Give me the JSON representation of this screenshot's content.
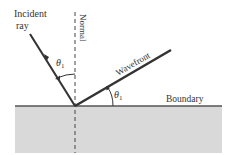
{
  "diagram": {
    "labels": {
      "incident_line1": "Incident",
      "incident_line2": "ray",
      "normal": "Normal",
      "wavefront": "Wavefront",
      "boundary": "Boundary",
      "theta_incident": "θ",
      "theta_incident_sub": "1",
      "theta_wavefront": "θ",
      "theta_wavefront_sub": "1"
    },
    "colors": {
      "medium_fill": "#d9d9d9",
      "boundary_line": "#555555",
      "ray": "#333333",
      "text": "#333333"
    }
  }
}
